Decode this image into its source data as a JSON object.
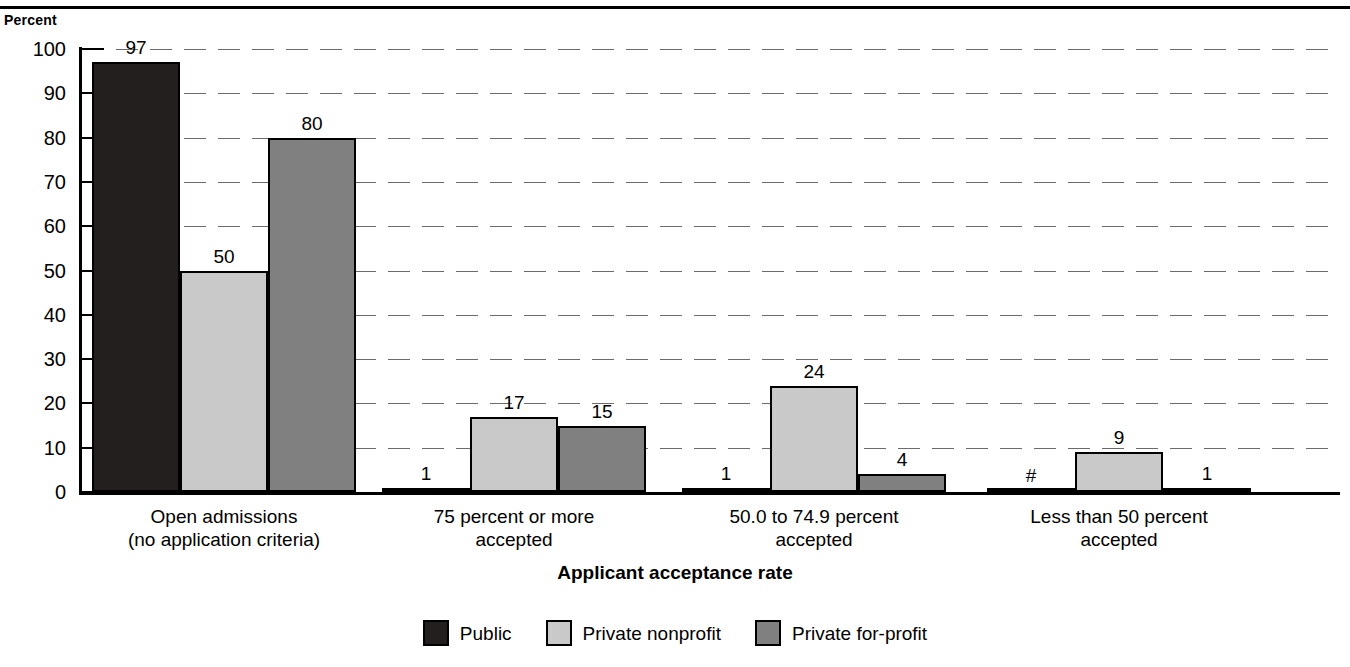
{
  "header": {
    "y_axis_title": "Percent",
    "cut_off_text": ""
  },
  "chart_data": {
    "type": "bar",
    "title": "",
    "xlabel": "Applicant acceptance rate",
    "ylabel": "Percent",
    "ylim": [
      0,
      100
    ],
    "ytick_labels": [
      "0",
      "10",
      "20",
      "30",
      "40",
      "50",
      "60",
      "70",
      "80",
      "90",
      "100"
    ],
    "ytick_values": [
      0,
      10,
      20,
      30,
      40,
      50,
      60,
      70,
      80,
      90,
      100
    ],
    "grid": true,
    "legend_position": "bottom",
    "categories": [
      "Open admissions\n(no application criteria)",
      "75 percent or more\naccepted",
      "50.0 to 74.9 percent\naccepted",
      "Less than 50 percent\naccepted"
    ],
    "category_lines": [
      [
        "Open admissions",
        "(no application criteria)"
      ],
      [
        "75 percent or more",
        "accepted"
      ],
      [
        "50.0 to 74.9 percent",
        "accepted"
      ],
      [
        "Less than 50 percent",
        "accepted"
      ]
    ],
    "series": [
      {
        "name": "Public",
        "color": "#231f1e",
        "values": [
          97,
          1,
          1,
          0.2
        ],
        "labels": [
          "97",
          "1",
          "1",
          "#"
        ]
      },
      {
        "name": "Private nonprofit",
        "color": "#c9c9c9",
        "values": [
          50,
          17,
          24,
          9
        ],
        "labels": [
          "50",
          "17",
          "24",
          "9"
        ]
      },
      {
        "name": "Private for-profit",
        "color": "#808080",
        "values": [
          80,
          15,
          4,
          1
        ],
        "labels": [
          "80",
          "15",
          "4",
          "1"
        ]
      }
    ]
  },
  "legend": {
    "items": [
      {
        "label": "Public",
        "swatch": "public"
      },
      {
        "label": "Private nonprofit",
        "swatch": "nonprofit"
      },
      {
        "label": "Private for-profit",
        "swatch": "forprofit"
      }
    ]
  }
}
